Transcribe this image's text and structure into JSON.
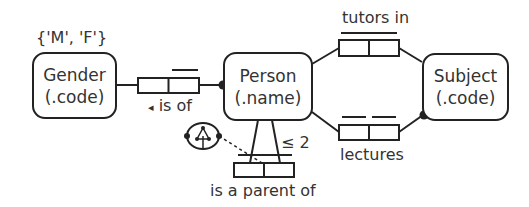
{
  "diagram": {
    "type": "ORM",
    "entities": [
      {
        "id": "gender",
        "name": "Gender",
        "refmode": "(.code)",
        "value_constraint": "{'M', 'F'}"
      },
      {
        "id": "person",
        "name": "Person",
        "refmode": "(.name)"
      },
      {
        "id": "subject",
        "name": "Subject",
        "refmode": "(.code)"
      }
    ],
    "fact_types": [
      {
        "id": "is_of",
        "reading": "is of",
        "reading_arrow": "◂",
        "roles": [
          "Person",
          "Gender"
        ],
        "uniqueness": "single bar over Person role",
        "mandatory": "Person"
      },
      {
        "id": "tutors_in",
        "reading": "tutors in",
        "roles": [
          "Person",
          "Subject"
        ],
        "uniqueness": "spanning bar"
      },
      {
        "id": "lectures",
        "reading": "lectures",
        "roles": [
          "Person",
          "Subject"
        ],
        "uniqueness": "separate bars on each role",
        "mandatory": "Subject"
      },
      {
        "id": "is_parent_of",
        "reading": "is a parent of",
        "roles": [
          "Person",
          "Person"
        ],
        "uniqueness": "spanning bar",
        "frequency_constraint": "≤ 2",
        "ring_constraint": "acyclic"
      }
    ],
    "colors": {
      "stroke": "#222222",
      "text": "#333333",
      "background": "#ffffff"
    }
  }
}
